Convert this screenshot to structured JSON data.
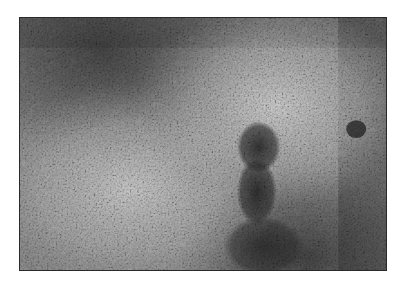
{
  "figure": {
    "type": "grayscale histology micrograph",
    "alt": "Grayscale micrograph of densely packed lymphoid tissue with pale germinal-center-like zones and a dark dense cluster near the center",
    "colors": {
      "background": "#ffffff",
      "frame": "#2a2a2a",
      "dense_region": "#3a3a3a",
      "pale_region": "#c4c4c4",
      "nuclei": "#1a1a1a"
    },
    "regions": [
      {
        "name": "dense-lymphocyte-zone-top-left",
        "tone": "dark"
      },
      {
        "name": "pale-zone-left-lower",
        "tone": "light"
      },
      {
        "name": "pale-zone-right-upper",
        "tone": "light"
      },
      {
        "name": "dark-central-cluster",
        "tone": "dark"
      },
      {
        "name": "dense-lymphocyte-zone-bottom-right",
        "tone": "dark"
      }
    ]
  }
}
